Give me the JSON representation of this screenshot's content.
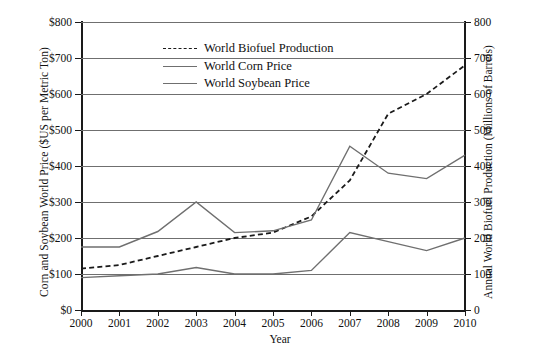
{
  "chart_data": {
    "type": "line",
    "title": "",
    "xlabel": "Year",
    "ylabel": "Corn and Soybean World Price ($US per Metric Ton)",
    "y2label": "Annual World Biofuel Production (Millions of Barrels)",
    "x": [
      2000,
      2001,
      2002,
      2003,
      2004,
      2005,
      2006,
      2007,
      2008,
      2009,
      2010
    ],
    "xtick_labels": [
      "2000",
      "2001",
      "2002",
      "2003",
      "2004",
      "2005",
      "2006",
      "2007",
      "2008",
      "2009",
      "2010"
    ],
    "ylim": [
      0,
      800
    ],
    "ytick_labels": [
      "$0",
      "$100",
      "$200",
      "$300",
      "$400",
      "$500",
      "$600",
      "$700",
      "$800"
    ],
    "ytick_values": [
      0,
      100,
      200,
      300,
      400,
      500,
      600,
      700,
      800
    ],
    "y2lim": [
      0,
      800
    ],
    "y2tick_labels": [
      "0",
      "100",
      "200",
      "300",
      "400",
      "500",
      "600",
      "700",
      "800"
    ],
    "y2tick_values": [
      0,
      100,
      200,
      300,
      400,
      500,
      600,
      700,
      800
    ],
    "grid": true,
    "legend_position": "upper-left-inside",
    "series": [
      {
        "name": "World Biofuel Production",
        "axis": "right",
        "style": "dashed",
        "color": "#1a1a1a",
        "values": [
          115,
          125,
          150,
          175,
          200,
          215,
          260,
          360,
          545,
          600,
          680
        ]
      },
      {
        "name": "World Corn Price",
        "axis": "left",
        "style": "solid",
        "color": "#6f6f6f",
        "values": [
          90,
          95,
          100,
          118,
          100,
          100,
          110,
          215,
          190,
          165,
          200
        ]
      },
      {
        "name": "World Soybean Price",
        "axis": "left",
        "style": "solid",
        "color": "#6f6f6f",
        "values": [
          175,
          175,
          218,
          300,
          215,
          220,
          250,
          455,
          380,
          365,
          430
        ]
      }
    ]
  }
}
